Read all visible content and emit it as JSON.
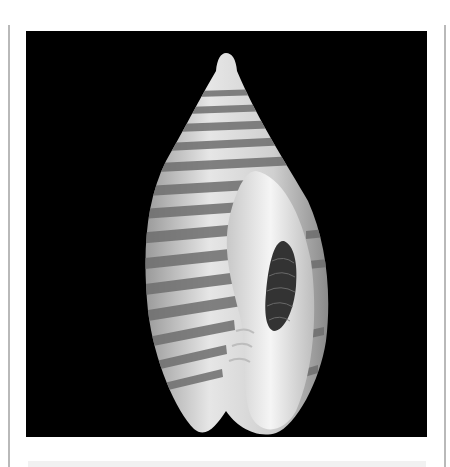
{
  "image": {
    "subject": "Banded cone-shaped sea shell on black background",
    "background_color": "#000000",
    "shell_colors": {
      "base": "#d9d9d9",
      "band": "#7a7a7a",
      "aperture": "#f2f2f2",
      "callus": "#3a3a3a"
    }
  }
}
